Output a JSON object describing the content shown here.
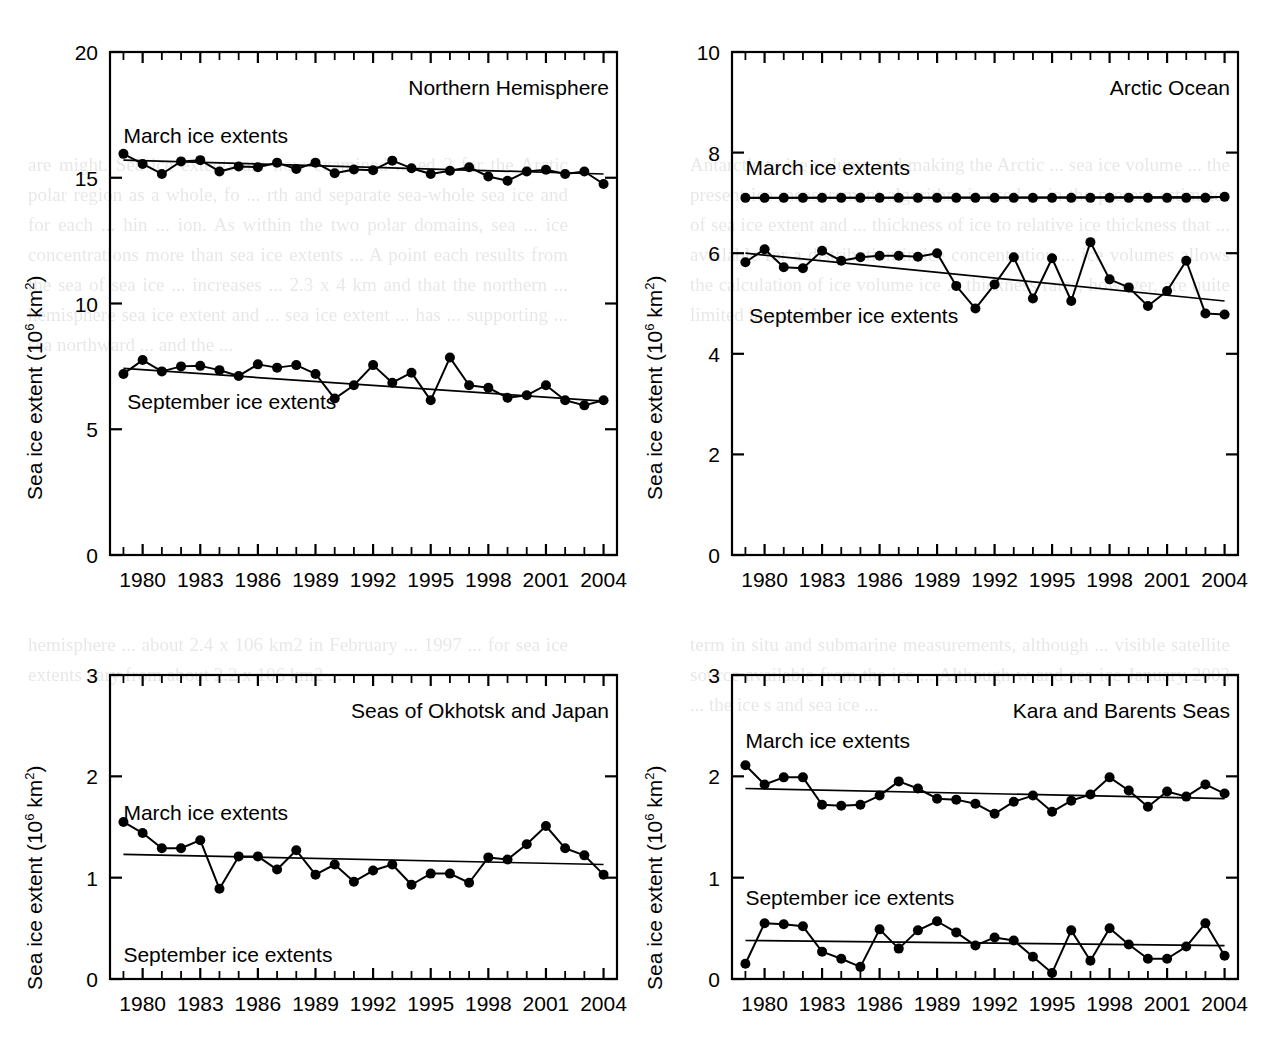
{
  "figure": {
    "ylabel_text": "Sea ice extent (10",
    "ylabel_sup": "6",
    "ylabel_tail": " km",
    "ylabel_sup2": "2",
    "ylabel_close": ")",
    "march_label": "March ice extents",
    "september_label": "September ice extents"
  },
  "bleed": {
    "left_top": "are might. Sea ice extents are now examined ... ed 2 for the Arctic polar region as a whole, fo ... rth and separate sea-whole sea ice and for each ... hin ... ion. As within the two polar domains, sea ... ice concentrations more than sea ice extents ... A point each results from the sea of sea ice ... increases ... 2.3 x 4 km  and that the northern ... hemisphere sea ice extent and ... sea ice extent ... has ... supporting ... sea northward ... and the ...",
    "right_top": "Antarctic to ice volume and making the Arctic ... sea ice volume ... the present ice measurement algorithm is used ... in the present  estimates of sea ice extent and ... thickness of ice to relative ice thickness that ... available for a distribution in ice concentration ... ice volumes allows the calculation of ice volume ice ... thickness rates, however, are quite limited in spatial ...",
    "left_bottom": "hemisphere ... about 2.4 x 106 km2  in February ... 1997 ... for sea ice extents vary from about 2.2 x 106 km2 ...",
    "right_bottom": "term in situ and submarine measurements, although ... visible satellite source available from the ice ... Although w and sea ice January 2003 ... the ice  s and sea ice ..."
  },
  "panels": [
    {
      "id": "northern-hemisphere",
      "title": "Northern Hemisphere",
      "ylim": [
        0,
        20
      ],
      "yticks": [
        0,
        5,
        10,
        15,
        20
      ],
      "xlim": [
        1978.3,
        2004.7
      ],
      "xticks": [
        1980,
        1983,
        1986,
        1989,
        1992,
        1995,
        1998,
        2001,
        2004
      ],
      "march_label_pos": {
        "x": 1979.0,
        "y": 16.6
      },
      "september_label_pos": {
        "x": 1979.2,
        "y": 6.0
      },
      "chart_data": {
        "type": "line",
        "title": "Northern Hemisphere",
        "xlabel": "",
        "ylabel": "Sea ice extent (10^6 km^2)",
        "ylim": [
          0,
          20
        ],
        "grid": false,
        "x": [
          1979,
          1980,
          1981,
          1982,
          1983,
          1984,
          1985,
          1986,
          1987,
          1988,
          1989,
          1990,
          1991,
          1992,
          1993,
          1994,
          1995,
          1996,
          1997,
          1998,
          1999,
          2000,
          2001,
          2002,
          2003,
          2004
        ],
        "series": [
          {
            "name": "March ice extents",
            "values": [
              15.95,
              15.55,
              15.15,
              15.65,
              15.7,
              15.25,
              15.45,
              15.42,
              15.6,
              15.35,
              15.6,
              15.18,
              15.33,
              15.3,
              15.68,
              15.38,
              15.15,
              15.28,
              15.42,
              15.05,
              14.88,
              15.25,
              15.32,
              15.15,
              15.25,
              14.75
            ],
            "trend": {
              "start_year": 1979,
              "start_value": 15.7,
              "end_year": 2004,
              "end_value": 15.15
            }
          },
          {
            "name": "September ice extents",
            "values": [
              7.2,
              7.75,
              7.3,
              7.5,
              7.52,
              7.35,
              7.12,
              7.58,
              7.45,
              7.55,
              7.2,
              6.22,
              6.75,
              7.55,
              6.85,
              7.25,
              6.15,
              7.85,
              6.75,
              6.65,
              6.25,
              6.35,
              6.75,
              6.15,
              5.95,
              6.15
            ],
            "trend": {
              "start_year": 1979,
              "start_value": 7.42,
              "end_year": 2004,
              "end_value": 6.12
            }
          }
        ]
      }
    },
    {
      "id": "arctic-ocean",
      "title": "Arctic Ocean",
      "ylim": [
        0,
        10
      ],
      "yticks": [
        0,
        2,
        4,
        6,
        8,
        10
      ],
      "xlim": [
        1978.3,
        2004.7
      ],
      "xticks": [
        1980,
        1983,
        1986,
        1989,
        1992,
        1995,
        1998,
        2001,
        2004
      ],
      "march_label_pos": {
        "x": 1979.0,
        "y": 7.65
      },
      "september_label_pos": {
        "x": 1979.2,
        "y": 4.72
      },
      "chart_data": {
        "type": "line",
        "title": "Arctic Ocean",
        "xlabel": "",
        "ylabel": "Sea ice extent (10^6 km^2)",
        "ylim": [
          0,
          10
        ],
        "grid": false,
        "x": [
          1979,
          1980,
          1981,
          1982,
          1983,
          1984,
          1985,
          1986,
          1987,
          1988,
          1989,
          1990,
          1991,
          1992,
          1993,
          1994,
          1995,
          1996,
          1997,
          1998,
          1999,
          2000,
          2001,
          2002,
          2003,
          2004
        ],
        "series": [
          {
            "name": "March ice extents",
            "values": [
              7.1,
              7.1,
              7.1,
              7.1,
              7.1,
              7.1,
              7.1,
              7.1,
              7.1,
              7.1,
              7.1,
              7.1,
              7.1,
              7.1,
              7.1,
              7.1,
              7.1,
              7.1,
              7.1,
              7.1,
              7.1,
              7.1,
              7.1,
              7.1,
              7.1,
              7.12
            ],
            "trend": {
              "start_year": 1979,
              "start_value": 7.1,
              "end_year": 2004,
              "end_value": 7.12
            }
          },
          {
            "name": "September ice extents",
            "values": [
              5.82,
              6.08,
              5.72,
              5.7,
              6.05,
              5.85,
              5.92,
              5.95,
              5.95,
              5.93,
              6.0,
              5.35,
              4.9,
              5.38,
              5.92,
              5.1,
              5.9,
              5.05,
              6.22,
              5.48,
              5.32,
              4.95,
              5.25,
              5.85,
              4.8,
              4.78,
              5.05
            ],
            "trend": {
              "start_year": 1979,
              "start_value": 6.0,
              "end_year": 2004,
              "end_value": 5.05
            }
          }
        ]
      }
    },
    {
      "id": "seas-of-okhotsk-and-japan",
      "title": "Seas of Okhotsk and Japan",
      "ylim": [
        0,
        3
      ],
      "yticks": [
        0,
        1,
        2,
        3
      ],
      "xlim": [
        1978.3,
        2004.7
      ],
      "xticks": [
        1980,
        1983,
        1986,
        1989,
        1992,
        1995,
        1998,
        2001,
        2004
      ],
      "march_label_pos": {
        "x": 1979.0,
        "y": 1.62
      },
      "september_label_pos": {
        "x": 1979.0,
        "y": 0.22
      },
      "chart_data": {
        "type": "line",
        "title": "Seas of Okhotsk and Japan",
        "xlabel": "",
        "ylabel": "Sea ice extent (10^6 km^2)",
        "ylim": [
          0,
          3
        ],
        "grid": false,
        "x": [
          1979,
          1980,
          1981,
          1982,
          1983,
          1984,
          1985,
          1986,
          1987,
          1988,
          1989,
          1990,
          1991,
          1992,
          1993,
          1994,
          1995,
          1996,
          1997,
          1998,
          1999,
          2000,
          2001,
          2002,
          2003,
          2004
        ],
        "series": [
          {
            "name": "March ice extents",
            "values": [
              1.55,
              1.44,
              1.29,
              1.29,
              1.37,
              0.89,
              1.21,
              1.21,
              1.08,
              1.27,
              1.03,
              1.13,
              0.96,
              1.07,
              1.13,
              0.93,
              1.04,
              1.04,
              0.95,
              1.2,
              1.18,
              1.33,
              1.51,
              1.29,
              1.22,
              1.03
            ],
            "trend": {
              "start_year": 1979,
              "start_value": 1.23,
              "end_year": 2004,
              "end_value": 1.13
            }
          },
          {
            "name": "September ice extents",
            "values": [],
            "trend": null
          }
        ]
      }
    },
    {
      "id": "kara-and-barents-seas",
      "title": "Kara and Barents Seas",
      "ylim": [
        0,
        3
      ],
      "yticks": [
        0,
        1,
        2,
        3
      ],
      "xlim": [
        1978.3,
        2004.7
      ],
      "xticks": [
        1980,
        1983,
        1986,
        1989,
        1992,
        1995,
        1998,
        2001,
        2004
      ],
      "march_label_pos": {
        "x": 1979.0,
        "y": 2.33
      },
      "september_label_pos": {
        "x": 1979.0,
        "y": 0.78
      },
      "chart_data": {
        "type": "line",
        "title": "Kara and Barents Seas",
        "xlabel": "",
        "ylabel": "Sea ice extent (10^6 km^2)",
        "ylim": [
          0,
          3
        ],
        "grid": false,
        "x": [
          1979,
          1980,
          1981,
          1982,
          1983,
          1984,
          1985,
          1986,
          1987,
          1988,
          1989,
          1990,
          1991,
          1992,
          1993,
          1994,
          1995,
          1996,
          1997,
          1998,
          1999,
          2000,
          2001,
          2002,
          2003,
          2004
        ],
        "series": [
          {
            "name": "March ice extents",
            "values": [
              2.11,
              1.92,
              1.99,
              1.99,
              1.72,
              1.71,
              1.72,
              1.81,
              1.95,
              1.88,
              1.78,
              1.77,
              1.73,
              1.63,
              1.75,
              1.81,
              1.65,
              1.76,
              1.82,
              1.99,
              1.86,
              1.7,
              1.85,
              1.8,
              1.92,
              1.83
            ],
            "trend": {
              "start_year": 1979,
              "start_value": 1.88,
              "end_year": 2004,
              "end_value": 1.78
            }
          },
          {
            "name": "September ice extents",
            "values": [
              0.15,
              0.55,
              0.54,
              0.52,
              0.27,
              0.2,
              0.12,
              0.49,
              0.3,
              0.48,
              0.57,
              0.46,
              0.33,
              0.41,
              0.38,
              0.22,
              0.06,
              0.48,
              0.18,
              0.5,
              0.34,
              0.2,
              0.2,
              0.32,
              0.55,
              0.23
            ],
            "trend": {
              "start_year": 1979,
              "start_value": 0.38,
              "end_year": 2004,
              "end_value": 0.33
            }
          }
        ]
      }
    }
  ]
}
